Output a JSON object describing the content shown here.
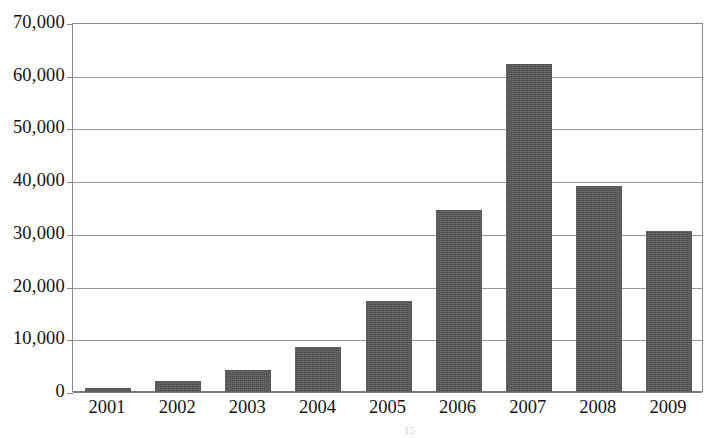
{
  "chart_data": {
    "type": "bar",
    "title": "",
    "xlabel": "",
    "ylabel": "",
    "categories": [
      "2001",
      "2002",
      "2003",
      "2004",
      "2005",
      "2006",
      "2007",
      "2008",
      "2009"
    ],
    "values": [
      800,
      2100,
      4100,
      8600,
      17300,
      34600,
      62300,
      39000,
      30600
    ],
    "ylim": [
      0,
      70000
    ],
    "ytick_values": [
      0,
      10000,
      20000,
      30000,
      40000,
      50000,
      60000,
      70000
    ],
    "ytick_labels": [
      "0",
      "10,000",
      "20,000",
      "30,000",
      "40,000",
      "50,000",
      "60,000",
      "70,000"
    ],
    "grid": true,
    "grid_axis": "y",
    "legend": false,
    "series": [
      {
        "name": "series-1",
        "values": [
          800,
          2100,
          4100,
          8600,
          17300,
          34600,
          62300,
          39000,
          30600
        ]
      }
    ],
    "bar_color": "#585858",
    "gridline_color": "#9a9a9a",
    "axis_color": "#8a8a8a",
    "background_color": "#ffffff"
  },
  "footnote": {
    "text": "15"
  }
}
